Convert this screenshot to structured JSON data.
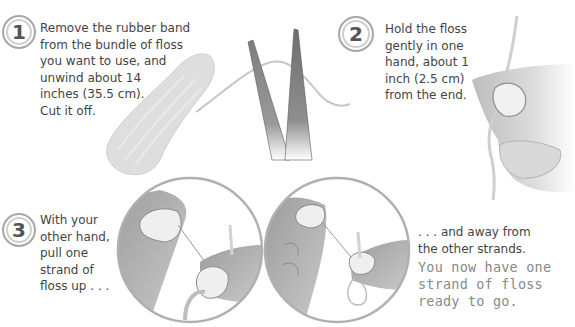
{
  "steps": [
    {
      "number": "1",
      "lines": [
        "Remove the rubber band",
        "from the bundle of floss",
        "you want to use, and",
        "unwind about 14",
        "inches (35.5 cm).",
        "Cut it off."
      ],
      "illustration": "floss-bundle-and-scissors"
    },
    {
      "number": "2",
      "lines": [
        "Hold the floss",
        "gently in one",
        "hand, about 1",
        "inch (2.5 cm)",
        "from the end."
      ],
      "illustration": "hand-holding-floss"
    },
    {
      "number": "3",
      "lines": [
        "With your",
        "other hand,",
        "pull one",
        "strand of",
        "floss up . . ."
      ],
      "continuation_lines": [
        ". . . and away from",
        "the other strands."
      ],
      "note_lines": [
        "You now have one",
        "strand of floss",
        "ready to go."
      ],
      "illustrations": [
        "pulling-strand-up-circle",
        "pulling-strand-away-circle"
      ]
    }
  ],
  "colors": {
    "text": "#444444",
    "note_text": "#8a8a8a",
    "badge_border": "#a8a8a8",
    "illustration_gray": "#b5b5b5"
  }
}
